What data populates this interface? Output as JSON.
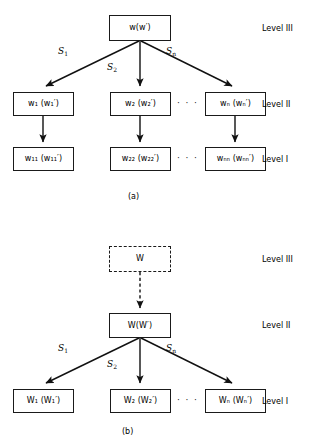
{
  "figure": {
    "background": "#ffffff",
    "stroke": "#1a1a1a",
    "panels": [
      {
        "id": "panel-a",
        "caption": "(a)",
        "levels": [
          {
            "key": "level-3",
            "label": "Level III"
          },
          {
            "key": "level-2",
            "label": "Level II"
          },
          {
            "key": "level-1",
            "label": "Level I"
          }
        ],
        "nodes": {
          "root": {
            "main": "w",
            "arg": "w",
            "arg_prime": true
          },
          "mid_1": {
            "main": "w",
            "sub": "1",
            "arg": "w",
            "arg_sub": "1",
            "arg_prime": true
          },
          "mid_2": {
            "main": "w",
            "sub": "2",
            "arg": "w",
            "arg_sub": "2",
            "arg_prime": true
          },
          "mid_n": {
            "main": "w",
            "sub": "n",
            "arg": "w",
            "arg_sub": "n",
            "arg_prime": true
          },
          "leaf_1": {
            "main": "w",
            "sub": "11",
            "arg": "w",
            "arg_sub": "11",
            "arg_prime": true
          },
          "leaf_2": {
            "main": "w",
            "sub": "22",
            "arg": "w",
            "arg_sub": "22",
            "arg_prime": true
          },
          "leaf_n": {
            "main": "w",
            "sub": "nn",
            "arg": "w",
            "arg_sub": "nn",
            "arg_prime": true
          }
        },
        "edge_labels": [
          {
            "key": "edge-s1",
            "symbol": "S",
            "sub": "1"
          },
          {
            "key": "edge-s2",
            "symbol": "S",
            "sub": "2"
          },
          {
            "key": "edge-sn",
            "symbol": "S",
            "sub": "n"
          }
        ],
        "ellipsis": "· · ·"
      },
      {
        "id": "panel-b",
        "caption": "(b)",
        "levels": [
          {
            "key": "level-3",
            "label": "Level III"
          },
          {
            "key": "level-2",
            "label": "Level II"
          },
          {
            "key": "level-1",
            "label": "Level I"
          }
        ],
        "nodes": {
          "root": {
            "main": "W",
            "dashed": true
          },
          "mid": {
            "main": "W",
            "arg": "W",
            "arg_prime": true
          },
          "leaf_1": {
            "main": "W",
            "sub": "1",
            "arg": "W",
            "arg_sub": "1",
            "arg_prime": true
          },
          "leaf_2": {
            "main": "W",
            "sub": "2",
            "arg": "W",
            "arg_sub": "2",
            "arg_prime": true
          },
          "leaf_n": {
            "main": "W",
            "sub": "n",
            "arg": "W",
            "arg_sub": "n",
            "arg_prime": true
          }
        },
        "edge_labels": [
          {
            "key": "edge-s1",
            "symbol": "S",
            "sub": "1"
          },
          {
            "key": "edge-s2",
            "symbol": "S",
            "sub": "2"
          },
          {
            "key": "edge-sn",
            "symbol": "S",
            "sub": "n"
          }
        ],
        "ellipsis": "· · ·"
      }
    ]
  },
  "panel_a": {
    "caption": "(a)",
    "level_3": "Level III",
    "level_2": "Level II",
    "level_1": "Level I",
    "root": "w(w′)",
    "mid_1": "w₁ (w₁′)",
    "mid_2": "w₂ (w₂′)",
    "mid_n": "wₙ (wₙ′)",
    "leaf_1": "w₁₁ (w₁₁′)",
    "leaf_2": "w₂₂ (w₂₂′)",
    "leaf_n": "wₙₙ (wₙₙ′)",
    "s1": "S",
    "s1_sub": "1",
    "s2": "S",
    "s2_sub": "2",
    "sn": "S",
    "sn_sub": "n",
    "ellipsis_mid": "· · ·",
    "ellipsis_leaf": "· · ·"
  },
  "panel_b": {
    "caption": "(b)",
    "level_3": "Level III",
    "level_2": "Level II",
    "level_1": "Level I",
    "root": "W",
    "mid": "W(W′)",
    "leaf_1": "W₁ (W₁′)",
    "leaf_2": "W₂ (W₂′)",
    "leaf_n": "Wₙ (Wₙ′)",
    "s1": "S",
    "s1_sub": "1",
    "s2": "S",
    "s2_sub": "2",
    "sn": "S",
    "sn_sub": "n",
    "ellipsis_leaf": "· · ·"
  }
}
